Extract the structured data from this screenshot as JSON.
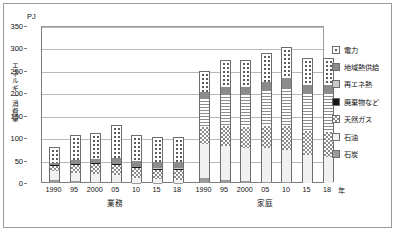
{
  "chart_data": {
    "type": "bar",
    "title": "",
    "subtitle": "",
    "unit_label": "PJ",
    "ylabel": "エネルギー消費量",
    "xlabel": "年",
    "ylim": [
      0,
      350
    ],
    "ytick_values": [
      0,
      50,
      100,
      150,
      200,
      250,
      300,
      350
    ],
    "ytick_labels": [
      "0",
      "50",
      "100",
      "150",
      "200",
      "250",
      "300",
      "350"
    ],
    "grid": true,
    "legend_position": "right",
    "stacked": true,
    "series": [
      {
        "name": "電力",
        "key": "denryoku",
        "pattern": "dotted"
      },
      {
        "name": "地域熱供給",
        "key": "chiiki",
        "pattern": "solid-gray"
      },
      {
        "name": "再エネ熱",
        "key": "saiene",
        "pattern": "light-gray"
      },
      {
        "name": "廃棄物など",
        "key": "haiki",
        "pattern": "black"
      },
      {
        "name": "天然ガス",
        "key": "gas",
        "pattern": "checker"
      },
      {
        "name": "石油",
        "key": "sekiyu",
        "pattern": "white"
      },
      {
        "name": "石炭",
        "key": "sekitan",
        "pattern": "gray"
      }
    ],
    "groups": [
      {
        "label": "業務",
        "categories": [
          "1990",
          "95",
          "2000",
          "05",
          "10",
          "15",
          "18"
        ],
        "bars": [
          {
            "year": "1990",
            "total": 78,
            "values": {
              "sekitan": 7,
              "sekiyu": 20,
              "gas": 10,
              "haiki": 3,
              "saiene": 0,
              "chiiki": 5,
              "denryoku": 33
            }
          },
          {
            "year": "95",
            "total": 104,
            "values": {
              "sekitan": 4,
              "sekiyu": 19,
              "gas": 18,
              "haiki": 2,
              "saiene": 0,
              "chiiki": 8,
              "denryoku": 53
            }
          },
          {
            "year": "2000",
            "total": 110,
            "values": {
              "sekitan": 3,
              "sekiyu": 17,
              "gas": 22,
              "haiki": 2,
              "saiene": 0,
              "chiiki": 9,
              "denryoku": 57
            }
          },
          {
            "year": "05",
            "total": 126,
            "values": {
              "sekitan": 2,
              "sekiyu": 15,
              "gas": 24,
              "haiki": 2,
              "saiene": 0,
              "chiiki": 13,
              "denryoku": 70
            }
          },
          {
            "year": "10",
            "total": 105,
            "values": {
              "sekitan": 1,
              "sekiyu": 10,
              "gas": 22,
              "haiki": 2,
              "saiene": 0,
              "chiiki": 13,
              "denryoku": 57
            }
          },
          {
            "year": "15",
            "total": 100,
            "values": {
              "sekitan": 1,
              "sekiyu": 7,
              "gas": 22,
              "haiki": 2,
              "saiene": 1,
              "chiiki": 14,
              "denryoku": 53
            }
          },
          {
            "year": "18",
            "total": 100,
            "values": {
              "sekitan": 1,
              "sekiyu": 6,
              "gas": 23,
              "haiki": 2,
              "saiene": 1,
              "chiiki": 14,
              "denryoku": 53
            }
          }
        ]
      },
      {
        "label": "家庭",
        "categories": [
          "1990",
          "95",
          "2000",
          "05",
          "10",
          "15",
          "18"
        ],
        "bars": [
          {
            "year": "1990",
            "total": 248,
            "values": {
              "sekitan": 11,
              "sekiyu": 76,
              "gas": 37,
              "haiki": 0,
              "saiene": 66,
              "chiiki": 13,
              "denryoku": 45
            }
          },
          {
            "year": "95",
            "total": 272,
            "values": {
              "sekitan": 6,
              "sekiyu": 77,
              "gas": 44,
              "haiki": 0,
              "saiene": 72,
              "chiiki": 15,
              "denryoku": 58
            }
          },
          {
            "year": "2000",
            "total": 272,
            "values": {
              "sekitan": 4,
              "sekiyu": 74,
              "gas": 46,
              "haiki": 0,
              "saiene": 75,
              "chiiki": 15,
              "denryoku": 58
            }
          },
          {
            "year": "05",
            "total": 288,
            "values": {
              "sekitan": 3,
              "sekiyu": 75,
              "gas": 49,
              "haiki": 0,
              "saiene": 81,
              "chiiki": 17,
              "denryoku": 63
            }
          },
          {
            "year": "10",
            "total": 300,
            "values": {
              "sekitan": 2,
              "sekiyu": 72,
              "gas": 52,
              "haiki": 0,
              "saiene": 86,
              "chiiki": 22,
              "denryoku": 66
            }
          },
          {
            "year": "15",
            "total": 277,
            "values": {
              "sekitan": 0,
              "sekiyu": 62,
              "gas": 53,
              "haiki": 0,
              "saiene": 85,
              "chiiki": 18,
              "denryoku": 59
            }
          },
          {
            "year": "18",
            "total": 277,
            "values": {
              "sekitan": 0,
              "sekiyu": 58,
              "gas": 56,
              "haiki": 0,
              "saiene": 86,
              "chiiki": 18,
              "denryoku": 59
            }
          }
        ]
      }
    ]
  },
  "legend": {
    "items": [
      {
        "label": "電力"
      },
      {
        "label": "地域熱供給"
      },
      {
        "label": "再エネ熱"
      },
      {
        "label": "廃棄物など"
      },
      {
        "label": "天然ガス"
      },
      {
        "label": "石油"
      },
      {
        "label": "石炭"
      }
    ]
  },
  "axis": {
    "unit": "PJ",
    "ylabel_chars": [
      "エ",
      "ネ",
      "ル",
      "ギ",
      "ー",
      "消",
      "費",
      "量"
    ],
    "year_suffix": "年"
  }
}
